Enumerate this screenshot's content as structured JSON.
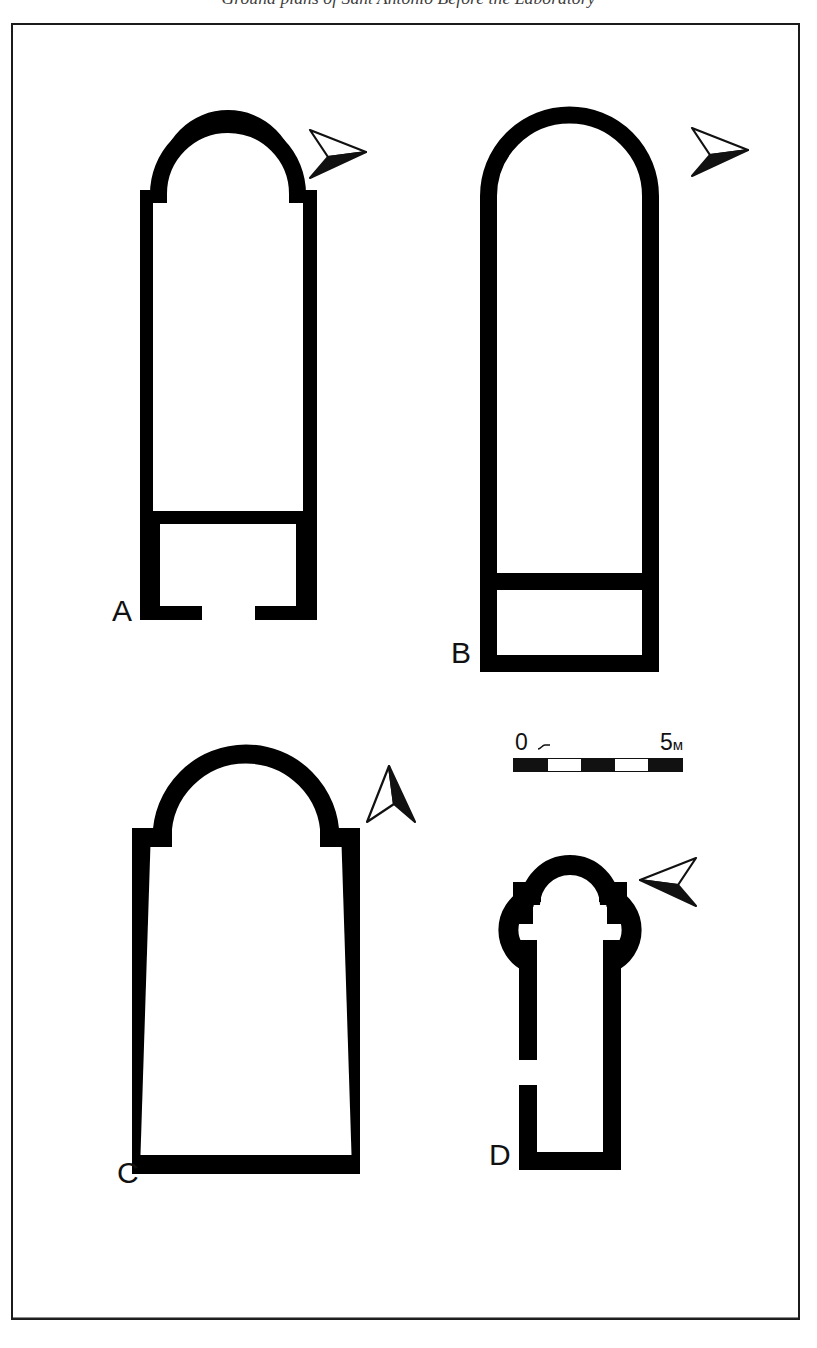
{
  "caption": {
    "text": "Ground plans of Sant'Antonio Before the Laboratory"
  },
  "plate": {
    "frame_color": "#1b1b1b",
    "background_color": "#ffffff",
    "wall_color": "#000000"
  },
  "plans": [
    {
      "id": "A",
      "label": "A",
      "description": "Single-nave church with narrower semicircular apse and stepped shoulders; internal cross-wall near the west end and a doorway gap in the west wall",
      "north_arrow": "north-arrow-right"
    },
    {
      "id": "B",
      "label": "B",
      "description": "Single-nave church with continuous horseshoe apse the full width of the nave; internal cross-wall forming an enclosed west chamber",
      "north_arrow": "north-arrow-right"
    },
    {
      "id": "C",
      "label": "C",
      "description": "Single-nave church with wide semicircular apse and stepped shoulders; slightly tapering nave walls and a closed west wall",
      "north_arrow": "north-arrow-up"
    },
    {
      "id": "D",
      "label": "D",
      "description": "Trefoil (triconch) headed church with three lobes and a long narrow nave; doorway gap in the west part of the south wall",
      "north_arrow": "north-arrow-left"
    }
  ],
  "scale_bar": {
    "name": "scale-bar",
    "start_label": "0",
    "end_label": "5",
    "unit": "м",
    "segments": 5,
    "segment_fill": [
      "fill",
      "blank",
      "fill",
      "blank",
      "fill"
    ],
    "length_meters": 5
  },
  "icons": {
    "north_arrow_right": "north-arrow-right-icon",
    "north_arrow_up": "north-arrow-up-icon",
    "north_arrow_left": "north-arrow-left-icon",
    "scale_tick": "scale-tick-icon"
  }
}
